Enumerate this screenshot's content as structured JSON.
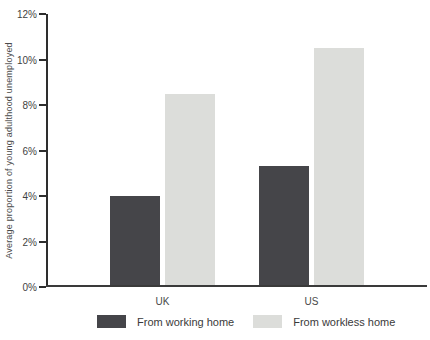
{
  "chart_data": {
    "type": "bar",
    "title": "",
    "xlabel": "",
    "ylabel": "Average proportion of young adulthood unemployed",
    "categories": [
      "UK",
      "US"
    ],
    "series": [
      {
        "name": "From working home",
        "color": "#454549",
        "values": [
          4.0,
          5.3
        ]
      },
      {
        "name": "From workless home",
        "color": "#dcddda",
        "values": [
          8.5,
          10.5
        ]
      }
    ],
    "ylim": [
      0,
      12
    ],
    "yticks": [
      {
        "value": 0,
        "label": "0%"
      },
      {
        "value": 2,
        "label": "2%"
      },
      {
        "value": 4,
        "label": "4%"
      },
      {
        "value": 6,
        "label": "6%"
      },
      {
        "value": 8,
        "label": "8%"
      },
      {
        "value": 10,
        "label": "10%"
      },
      {
        "value": 12,
        "label": "12%"
      }
    ],
    "grid": false,
    "legend_position": "bottom",
    "axis_color": "#2e2e2e",
    "text_color": "#4a4a4a",
    "background_color": "#ffffff"
  }
}
